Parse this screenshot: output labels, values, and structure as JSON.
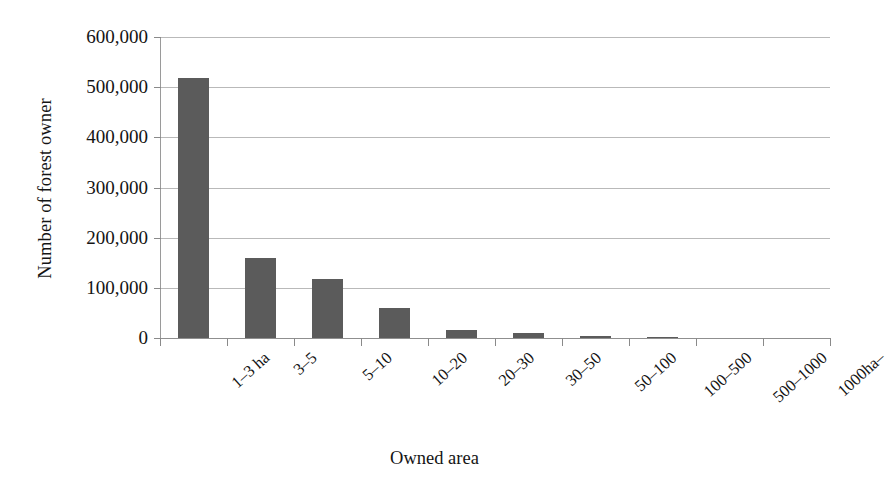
{
  "chart_data": {
    "type": "bar",
    "title": "",
    "subtitle": "",
    "xlabel": "Owned area",
    "ylabel": "Number of forest owner",
    "categories": [
      "1–3 ha",
      "3–5",
      "5–10",
      "10–20",
      "20–30",
      "30–50",
      "50–100",
      "100–500",
      "500–1000",
      "1000ha–"
    ],
    "values": [
      518000,
      160000,
      117000,
      60000,
      16000,
      10000,
      4000,
      2000,
      0,
      0
    ],
    "ylim": [
      0,
      600000
    ],
    "ytick_values": [
      0,
      100000,
      200000,
      300000,
      400000,
      500000,
      600000
    ],
    "ytick_labels": [
      "0",
      "100,000",
      "200,000",
      "300,000",
      "400,000",
      "500,000",
      "600,000"
    ],
    "grid": true,
    "grid_axis": "y",
    "legend": false,
    "legend_position": "none",
    "bar_color": "#5b5b5b",
    "gridline_color": "#b9b9b9",
    "axis_color": "#8f8f8f",
    "background_color": "#ffffff",
    "bar_width_ratio": 0.45,
    "xtick_label_rotation": -42
  }
}
